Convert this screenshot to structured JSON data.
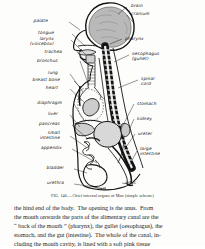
{
  "figure": {
    "caption": "FIG. 146.—Chief internal organs of Man (simple scheme)",
    "labels_left": [
      {
        "text": "palate",
        "x": 46,
        "y": 21
      },
      {
        "text": "tongue",
        "x": 52,
        "y": 33
      },
      {
        "text": "larynx",
        "x": 52,
        "y": 39
      },
      {
        "text": "(voicebox)",
        "x": 55,
        "y": 44
      },
      {
        "text": "trachea",
        "x": 62,
        "y": 52
      },
      {
        "text": "bronchus",
        "x": 55,
        "y": 61
      },
      {
        "text": "lung",
        "x": 58,
        "y": 73
      },
      {
        "text": "breast bone",
        "x": 50,
        "y": 80
      },
      {
        "text": "heart",
        "x": 57,
        "y": 88
      },
      {
        "text": "diaphragm",
        "x": 50,
        "y": 103
      },
      {
        "text": "liver",
        "x": 58,
        "y": 114
      },
      {
        "text": "pancreas",
        "x": 52,
        "y": 124
      },
      {
        "text": "small",
        "x": 56,
        "y": 133
      },
      {
        "text": "intestine",
        "x": 52,
        "y": 138
      },
      {
        "text": "appendix",
        "x": 53,
        "y": 148
      },
      {
        "text": "bladder",
        "x": 57,
        "y": 168
      },
      {
        "text": "urethra",
        "x": 57,
        "y": 183
      }
    ],
    "labels_right": [
      {
        "text": "brain",
        "x": 129,
        "y": 5
      },
      {
        "text": "cranium",
        "x": 129,
        "y": 13
      },
      {
        "text": "pharynx",
        "x": 124,
        "y": 38
      },
      {
        "text": "oesophagus",
        "x": 131,
        "y": 53
      },
      {
        "text": "(gullet)",
        "x": 131,
        "y": 58
      },
      {
        "text": "spinal",
        "x": 140,
        "y": 78
      },
      {
        "text": "cord",
        "x": 140,
        "y": 83
      },
      {
        "text": "stomach",
        "x": 136,
        "y": 103
      },
      {
        "text": "kidney",
        "x": 136,
        "y": 118
      },
      {
        "text": "ureter",
        "x": 137,
        "y": 133
      },
      {
        "text": "large",
        "x": 139,
        "y": 148
      },
      {
        "text": "intestine",
        "x": 139,
        "y": 153
      },
      {
        "text": "anus",
        "x": 124,
        "y": 182
      }
    ]
  },
  "body": {
    "lines": [
      "the hind end of the body.  The opening is the anus.  From",
      "the mouth onwards the parts of the alimentary canal are the",
      "“ back of the mouth ” (pharynx), the gullet (oesophagus), the",
      "stomach, and the gut (intestine).  The whole of the canal, in-",
      "cluding the mouth cavity, is lined with a soft pink tissue"
    ]
  },
  "colors": {
    "ink": "#141414",
    "paper": "#fdfdfb",
    "brain_fill": "#b9b9b9",
    "organ_fill": "#d8d8d8",
    "spine_dark": "#1a1a1a"
  }
}
